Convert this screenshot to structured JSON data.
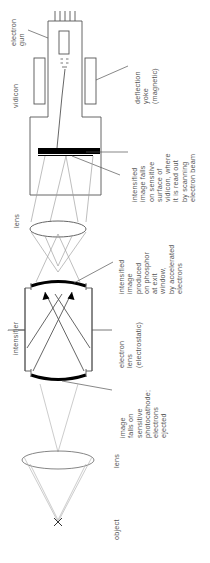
{
  "figure": {
    "orientation": "rotated-90-ccw",
    "background_color": "#ffffff",
    "line_color": "#555555",
    "solid_fill_color": "#000000"
  },
  "labels": {
    "electron_gun": "electron\ngun",
    "electron_gun_lines": [
      "electron",
      "gun"
    ],
    "vidicon": "vidicon",
    "deflection_yoke_lines": [
      "deflection",
      "yoke",
      "(magnetic)"
    ],
    "intensified_on_vidicon_lines": [
      "intensified",
      "image falls",
      "on sensitive",
      "surface of",
      "vidicon, where",
      "it is read out",
      "by scanning",
      "electron beam"
    ],
    "lens_upper": "lens",
    "intensified_on_phosphor_lines": [
      "intensified",
      "image",
      "produced",
      "on phosphor",
      "at exit",
      "window,",
      "by accelerated",
      "electrons"
    ],
    "intensifier": "intensifier",
    "electron_lens_lines": [
      "electron",
      "lens",
      "(electrostatic)"
    ],
    "photocathode_lines": [
      "image",
      "falls on",
      "sensitive",
      "photocathode;",
      "electrons",
      "ejected"
    ],
    "lens_lower": "lens",
    "object": "object",
    "object_marker": "×"
  },
  "components": [
    {
      "name": "electron-gun",
      "kind": "assembly",
      "label": "electron gun"
    },
    {
      "name": "vidicon-tube",
      "kind": "enclosure",
      "label": "vidicon"
    },
    {
      "name": "deflection-yoke",
      "kind": "coil-pair",
      "label": "deflection yoke (magnetic)"
    },
    {
      "name": "vidicon-target",
      "kind": "solid-bar",
      "label": "sensitive surface of vidicon"
    },
    {
      "name": "coupling-lens",
      "kind": "lens-ellipse",
      "label": "lens"
    },
    {
      "name": "exit-window-phosphor",
      "kind": "curved-solid",
      "label": "phosphor at exit window"
    },
    {
      "name": "intensifier-tube",
      "kind": "enclosure",
      "label": "intensifier"
    },
    {
      "name": "electron-lens",
      "kind": "electrostatic-lens",
      "label": "electron lens (electrostatic)"
    },
    {
      "name": "photocathode",
      "kind": "curved-solid",
      "label": "photocathode"
    },
    {
      "name": "objective-lens",
      "kind": "lens-ellipse",
      "label": "lens"
    },
    {
      "name": "object-point",
      "kind": "cross-marker",
      "label": "object"
    }
  ]
}
